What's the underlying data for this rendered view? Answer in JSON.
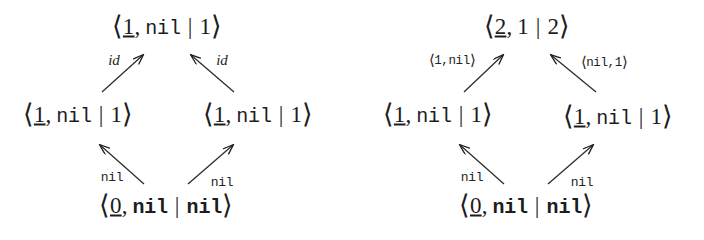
{
  "figure": {
    "background_color": "#ffffff",
    "ink_color": "#1d1d1d",
    "type": "commutative-diagram-pair"
  },
  "diagrams": [
    {
      "id": "left",
      "nodes": {
        "top": {
          "open": "⟨",
          "first": "1",
          "sep": ",",
          "second": "nil",
          "bar": "|",
          "third": "1",
          "close": "⟩"
        },
        "mid_left": {
          "open": "⟨",
          "first": "1",
          "sep": ",",
          "second": "nil",
          "bar": "|",
          "third": "1",
          "close": "⟩"
        },
        "mid_right": {
          "open": "⟨",
          "first": "1",
          "sep": ",",
          "second": "nil",
          "bar": "|",
          "third": "1",
          "close": "⟩"
        },
        "bottom": {
          "open": "⟨",
          "first": "0",
          "sep": ",",
          "second": "nil",
          "bar": "|",
          "third": "nil",
          "close": "⟩"
        }
      },
      "edges": {
        "mid_left_to_top": "id",
        "mid_right_to_top": "id",
        "bottom_to_mid_left": "nil",
        "bottom_to_mid_right": "nil"
      }
    },
    {
      "id": "right",
      "nodes": {
        "top": {
          "open": "⟨",
          "first": "2",
          "sep": ",",
          "second": "1",
          "bar": "|",
          "third": "2",
          "close": "⟩"
        },
        "mid_left": {
          "open": "⟨",
          "first": "1",
          "sep": ",",
          "second": "nil",
          "bar": "|",
          "third": "1",
          "close": "⟩"
        },
        "mid_right": {
          "open": "⟨",
          "first": "1",
          "sep": ",",
          "second": "nil",
          "bar": "|",
          "third": "1",
          "close": "⟩"
        },
        "bottom": {
          "open": "⟨",
          "first": "0",
          "sep": ",",
          "second": "nil",
          "bar": "|",
          "third": "nil",
          "close": "⟩"
        }
      },
      "edges": {
        "mid_left_to_top": {
          "open": "⟨",
          "text": "1,nil",
          "close": "⟩"
        },
        "mid_right_to_top": {
          "open": "⟨",
          "text": "nil,1",
          "close": "⟩"
        },
        "bottom_to_mid_left": "nil",
        "bottom_to_mid_right": "nil"
      }
    }
  ]
}
